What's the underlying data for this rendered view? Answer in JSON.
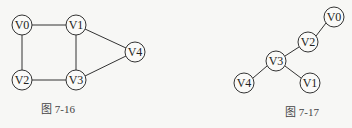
{
  "colors": {
    "background": "#f7f7f5",
    "stroke": "#333333",
    "node_fill": "#fafaf8",
    "text": "#222222"
  },
  "figures": [
    {
      "caption": "图 7-16",
      "type": "undirected-graph",
      "nodes": [
        {
          "id": "V0",
          "label": "V0",
          "x": 22,
          "y": 25
        },
        {
          "id": "V1",
          "label": "V1",
          "x": 76,
          "y": 25
        },
        {
          "id": "V2",
          "label": "V2",
          "x": 22,
          "y": 80
        },
        {
          "id": "V3",
          "label": "V3",
          "x": 76,
          "y": 80
        },
        {
          "id": "V4",
          "label": "V4",
          "x": 135,
          "y": 52
        }
      ],
      "edges": [
        [
          "V0",
          "V1"
        ],
        [
          "V0",
          "V2"
        ],
        [
          "V1",
          "V3"
        ],
        [
          "V2",
          "V3"
        ],
        [
          "V1",
          "V4"
        ],
        [
          "V3",
          "V4"
        ]
      ]
    },
    {
      "caption": "图 7-17",
      "type": "spanning-tree",
      "nodes": [
        {
          "id": "V0",
          "label": "V0",
          "x": 334,
          "y": 17
        },
        {
          "id": "V2",
          "label": "V2",
          "x": 308,
          "y": 42
        },
        {
          "id": "V3",
          "label": "V3",
          "x": 276,
          "y": 61
        },
        {
          "id": "V4",
          "label": "V4",
          "x": 244,
          "y": 83
        },
        {
          "id": "V1",
          "label": "V1",
          "x": 310,
          "y": 83
        }
      ],
      "edges": [
        [
          "V0",
          "V2"
        ],
        [
          "V2",
          "V3"
        ],
        [
          "V3",
          "V4"
        ],
        [
          "V3",
          "V1"
        ]
      ]
    }
  ]
}
